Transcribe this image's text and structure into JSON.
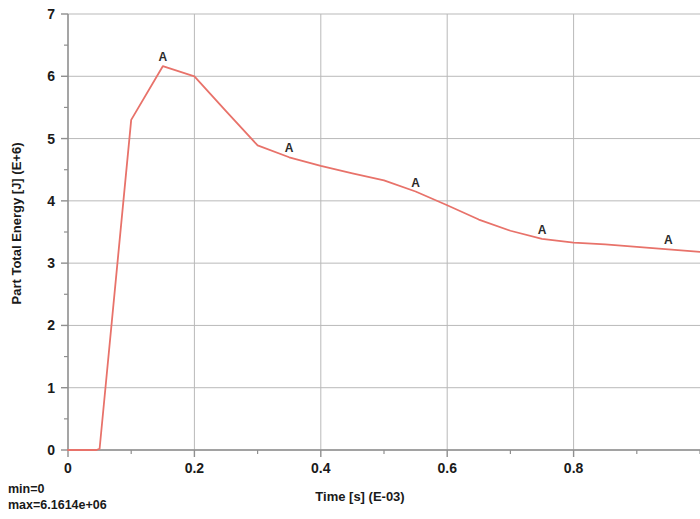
{
  "chart_data": {
    "type": "line",
    "title": "",
    "xlabel": "Time [s] (E-03)",
    "ylabel": "Part Total Energy [J] (E+6)",
    "xlim": [
      0,
      1.0
    ],
    "ylim": [
      0,
      7
    ],
    "x_ticks": [
      0,
      0.2,
      0.4,
      0.6,
      0.8
    ],
    "x_tick_labels": [
      "0",
      "0.2",
      "0.4",
      "0.6",
      "0.8"
    ],
    "x_minor_step": 0.1,
    "y_ticks": [
      0,
      1,
      2,
      3,
      4,
      5,
      6,
      7
    ],
    "y_tick_labels": [
      "0",
      "1",
      "2",
      "3",
      "4",
      "5",
      "6",
      "7"
    ],
    "y_minor_step": 0.5,
    "grid": "major-xy",
    "legend": "none",
    "line_color": "#e8726a",
    "series": [
      {
        "name": "A",
        "marker_label": "A",
        "marker_x": [
          0.15,
          0.35,
          0.55,
          0.75,
          0.95
        ],
        "x": [
          0.0,
          0.045,
          0.05,
          0.1,
          0.15,
          0.2,
          0.25,
          0.3,
          0.35,
          0.4,
          0.45,
          0.5,
          0.55,
          0.6,
          0.65,
          0.7,
          0.75,
          0.8,
          0.85,
          0.9,
          0.95,
          1.0
        ],
        "values": [
          0.0,
          0.0,
          0.02,
          5.3,
          6.1614,
          6.0,
          5.44,
          4.89,
          4.7,
          4.56,
          4.44,
          4.33,
          4.15,
          3.93,
          3.7,
          3.52,
          3.39,
          3.33,
          3.3,
          3.26,
          3.22,
          3.18
        ]
      }
    ],
    "annotations": {
      "min_label": "min=0",
      "max_label": "max=6.1614e+06"
    }
  },
  "axes": {
    "y_title": "Part Total Energy [J] (E+6)",
    "x_title": "Time [s] (E-03)"
  },
  "footer": {
    "min_text": "min=0",
    "max_text": "max=6.1614e+06"
  }
}
